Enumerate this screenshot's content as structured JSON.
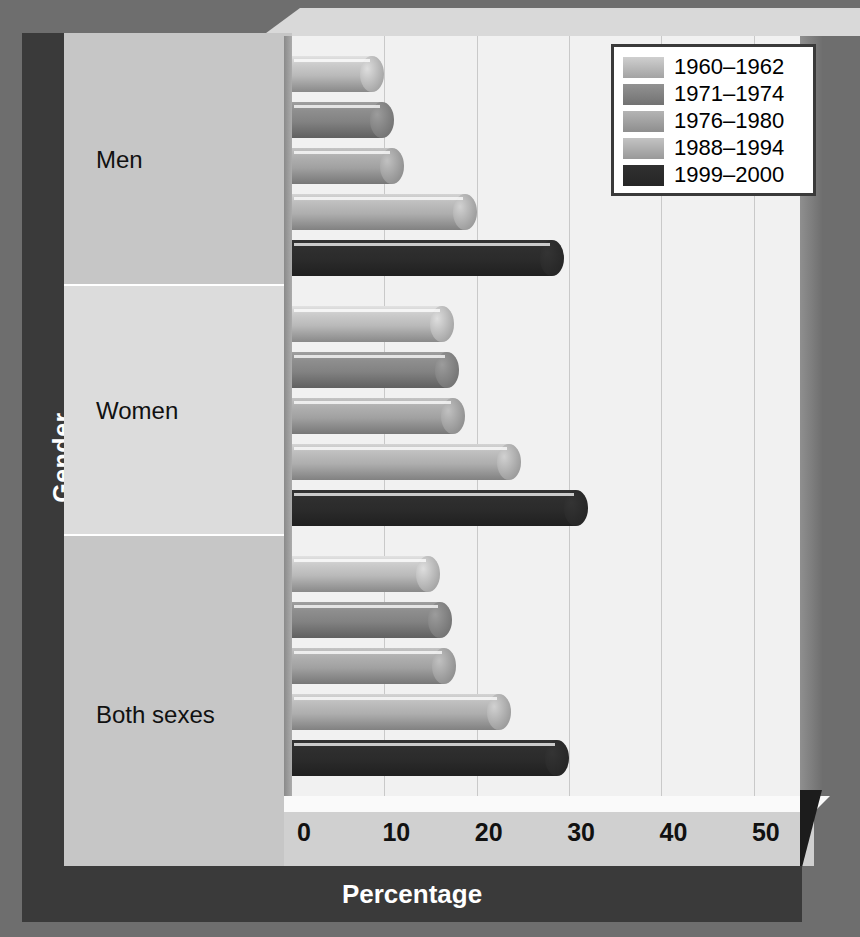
{
  "chart_data": {
    "type": "bar",
    "orientation": "horizontal",
    "title": "",
    "xlabel": "Percentage",
    "ylabel": "Gender",
    "xlim": [
      0,
      55
    ],
    "xticks": [
      0,
      10,
      20,
      30,
      40,
      50
    ],
    "xtick_labels": [
      "0",
      "10",
      "20",
      "30",
      "40",
      "50"
    ],
    "grid": true,
    "legend_position": "top-right",
    "categories": [
      "Men",
      "Women",
      "Both sexes"
    ],
    "series": [
      {
        "name": "1960–1962",
        "color": "#b9b9b9",
        "values": [
          10.0,
          17.5,
          16.0
        ]
      },
      {
        "name": "1971–1974",
        "color": "#828282",
        "values": [
          11.0,
          18.1,
          17.3
        ]
      },
      {
        "name": "1976–1980",
        "color": "#a1a1a1",
        "values": [
          12.1,
          18.7,
          17.8
        ]
      },
      {
        "name": "1988–1994",
        "color": "#aeaeae",
        "values": [
          20.0,
          24.8,
          23.7
        ]
      },
      {
        "name": "1999–2000",
        "color": "#2b2b2b",
        "values": [
          29.5,
          32.0,
          30.0
        ]
      }
    ]
  },
  "axis": {
    "x_title": "Percentage",
    "y_title": "Gender",
    "tick_labels": [
      "0",
      "10",
      "20",
      "30",
      "40",
      "50"
    ]
  },
  "categories": [
    {
      "label": "Men"
    },
    {
      "label": "Women"
    },
    {
      "label": "Both sexes"
    }
  ],
  "legend": {
    "items": [
      {
        "label": "1960–1962",
        "color": "#b9b9b9"
      },
      {
        "label": "1971–1974",
        "color": "#828282"
      },
      {
        "label": "1976–1980",
        "color": "#a1a1a1"
      },
      {
        "label": "1988–1994",
        "color": "#aeaeae"
      },
      {
        "label": "1999–2000",
        "color": "#2b2b2b"
      }
    ]
  },
  "theme": {
    "background": "#6e6e6e",
    "panel": "#c8c8c8",
    "plot_background": "#f1f1f1",
    "gridline": "#c9c9c9",
    "spine": "#3a3a3a",
    "text_light": "#ffffff",
    "text_dark": "#111111"
  }
}
